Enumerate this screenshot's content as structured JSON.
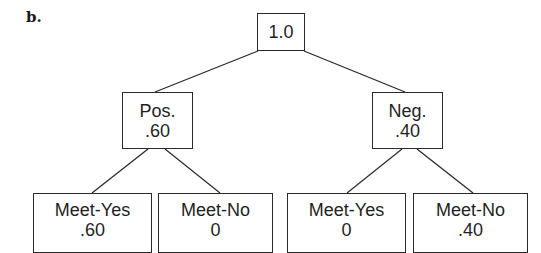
{
  "panel_label": "b.",
  "tree": {
    "root": {
      "label": "1.0"
    },
    "branches": [
      {
        "label": "Pos.",
        "value": ".60",
        "children": [
          {
            "label": "Meet-Yes",
            "value": ".60"
          },
          {
            "label": "Meet-No",
            "value": "0"
          }
        ]
      },
      {
        "label": "Neg.",
        "value": ".40",
        "children": [
          {
            "label": "Meet-Yes",
            "value": "0"
          },
          {
            "label": "Meet-No",
            "value": ".40"
          }
        ]
      }
    ]
  },
  "colors": {
    "stroke": "#2a2a2a",
    "text": "#1f1f1f",
    "background": "#ffffff"
  }
}
